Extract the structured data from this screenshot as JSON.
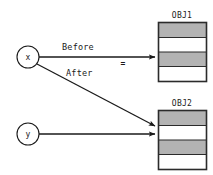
{
  "diagram": {
    "type": "pointer-reassignment-diagram",
    "background_color": "#ffffff",
    "stroke_color": "#1a1a1a",
    "cell_fill_gray": "#b3b3b3",
    "cell_fill_white": "#ffffff",
    "nodes": [
      {
        "id": "x",
        "label": "x",
        "shape": "circle",
        "cx": 28,
        "cy": 57,
        "r": 11
      },
      {
        "id": "y",
        "label": "y",
        "shape": "circle",
        "cx": 28,
        "cy": 134,
        "r": 11
      }
    ],
    "objects": [
      {
        "id": "obj1",
        "title": "OBJ1",
        "x": 158,
        "y": 22,
        "width": 49,
        "height": 60,
        "rows": [
          "gray",
          "white",
          "gray",
          "white"
        ]
      },
      {
        "id": "obj2",
        "title": "OBJ2",
        "x": 158,
        "y": 110,
        "width": 49,
        "height": 60,
        "rows": [
          "gray",
          "white",
          "gray",
          "white"
        ]
      }
    ],
    "edges": [
      {
        "id": "before-edge",
        "label": "Before",
        "from": "x",
        "to": "obj1",
        "style": "solid-arrow",
        "label_x": 62,
        "label_y": 47
      },
      {
        "id": "after-edge",
        "label": "After",
        "from": "x",
        "to": "obj2",
        "style": "solid-arrow",
        "label_x": 65,
        "label_y": 74
      },
      {
        "id": "y-edge",
        "label": "",
        "from": "y",
        "to": "obj2",
        "style": "solid-arrow",
        "label_x": 0,
        "label_y": 0
      }
    ],
    "annotations": [
      {
        "id": "equals-mark",
        "text": "=",
        "x": 123,
        "y": 63
      }
    ]
  }
}
